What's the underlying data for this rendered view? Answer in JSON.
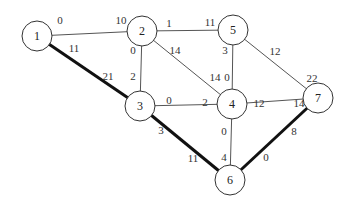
{
  "nodes": [
    {
      "id": "1",
      "x": 37,
      "y": 36
    },
    {
      "id": "2",
      "x": 142,
      "y": 31
    },
    {
      "id": "3",
      "x": 140,
      "y": 106
    },
    {
      "id": "4",
      "x": 232,
      "y": 104
    },
    {
      "id": "5",
      "x": 233,
      "y": 30
    },
    {
      "id": "6",
      "x": 230,
      "y": 180
    },
    {
      "id": "7",
      "x": 318,
      "y": 98
    }
  ],
  "edges": [
    {
      "from": "1",
      "to": "2",
      "bold": false,
      "label_from": "0",
      "label_to": "10"
    },
    {
      "from": "1",
      "to": "3",
      "bold": true,
      "label_from": "11",
      "label_to": "21"
    },
    {
      "from": "2",
      "to": "5",
      "bold": false,
      "label_from": "1",
      "label_to": "11"
    },
    {
      "from": "2",
      "to": "3",
      "bold": false,
      "label_from": "0",
      "label_to": "2"
    },
    {
      "from": "2",
      "to": "4",
      "bold": false,
      "label_from": "14",
      "label_to": "14"
    },
    {
      "from": "5",
      "to": "4",
      "bold": false,
      "label_from": "3",
      "label_to": "0"
    },
    {
      "from": "5",
      "to": "7",
      "bold": false,
      "label_from": "12",
      "label_to": "22"
    },
    {
      "from": "3",
      "to": "4",
      "bold": false,
      "label_from": "0",
      "label_to": "2"
    },
    {
      "from": "4",
      "to": "7",
      "bold": false,
      "label_from": "12",
      "label_to": "14"
    },
    {
      "from": "3",
      "to": "6",
      "bold": true,
      "label_from": "3",
      "label_to": "11"
    },
    {
      "from": "4",
      "to": "6",
      "bold": false,
      "label_from": "0",
      "label_to": "4"
    },
    {
      "from": "7",
      "to": "6",
      "bold": true,
      "label_from": "8",
      "label_to": "0"
    }
  ],
  "labels": {
    "e12_from": "0",
    "e12_to": "10",
    "e13_from": "11",
    "e13_to": "21",
    "e25_from": "1",
    "e25_to": "11",
    "e23_from": "0",
    "e23_to": "2",
    "e24_from": "14",
    "e24_to": "14",
    "e54_from": "3",
    "e54_to": "0",
    "e57_from": "12",
    "e57_to": "22",
    "e34_from": "0",
    "e34_to": "2",
    "e47_from": "12",
    "e47_to": "14",
    "e36_from": "3",
    "e36_to": "11",
    "e46_from": "0",
    "e46_to": "4",
    "e76_from": "8",
    "e76_to": "0"
  },
  "node_labels": {
    "n1": "1",
    "n2": "2",
    "n3": "3",
    "n4": "4",
    "n5": "5",
    "n6": "6",
    "n7": "7"
  }
}
